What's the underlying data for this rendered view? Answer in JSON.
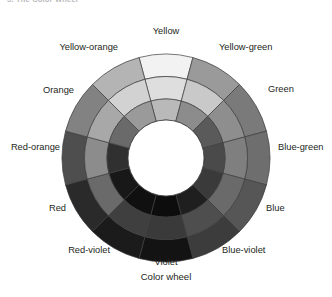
{
  "page": {
    "cutoff_heading": "5.  The Color Wheel",
    "caption": "Color wheel",
    "background_color": "#ffffff",
    "text_color": "#231f20"
  },
  "wheel": {
    "center_x": 166,
    "center_y": 158,
    "outer_radius": 104,
    "ring_radii": [
      104,
      81.5,
      59,
      38
    ],
    "stroke_color": "#3c3c3c",
    "hole_color": "#ffffff",
    "ring_names": [
      "outer",
      "middle",
      "inner"
    ],
    "sectors": [
      {
        "label": "Yellow",
        "angle_deg": 0,
        "label_x": 166,
        "label_y": 26,
        "label_align": "center",
        "shades": [
          "#f2f2f2",
          "#dedede",
          "#b9b9b9"
        ]
      },
      {
        "label": "Yellow-green",
        "angle_deg": 30,
        "label_x": 219,
        "label_y": 42,
        "label_align": "left",
        "shades": [
          "#9a9a9a",
          "#c9c9c9",
          "#8c8c8c"
        ]
      },
      {
        "label": "Green",
        "angle_deg": 60,
        "label_x": 268,
        "label_y": 84,
        "label_align": "left",
        "shades": [
          "#7a7a7a",
          "#8e8e8e",
          "#5a5a5a"
        ]
      },
      {
        "label": "Blue-green",
        "angle_deg": 90,
        "label_x": 278,
        "label_y": 142,
        "label_align": "left",
        "shades": [
          "#6e6e6e",
          "#7f7f7f",
          "#4a4a4a"
        ]
      },
      {
        "label": "Blue",
        "angle_deg": 120,
        "label_x": 266,
        "label_y": 203,
        "label_align": "left",
        "shades": [
          "#565656",
          "#6a6a6a",
          "#3a3a3a"
        ]
      },
      {
        "label": "Blue-violet",
        "angle_deg": 150,
        "label_x": 222,
        "label_y": 245,
        "label_align": "left",
        "shades": [
          "#3c3c3c",
          "#4e4e4e",
          "#1f1f1f"
        ]
      },
      {
        "label": "Violet",
        "angle_deg": 180,
        "label_x": 166,
        "label_y": 257,
        "label_align": "center",
        "shades": [
          "#131313",
          "#3a3a3a",
          "#0d0d0d"
        ]
      },
      {
        "label": "Red-violet",
        "angle_deg": 210,
        "label_x": 110,
        "label_y": 245,
        "label_align": "right",
        "shades": [
          "#1b1b1b",
          "#3f3f3f",
          "#101010"
        ]
      },
      {
        "label": "Red",
        "angle_deg": 240,
        "label_x": 66,
        "label_y": 203,
        "label_align": "right",
        "shades": [
          "#2a2a2a",
          "#6a6a6a",
          "#181818"
        ]
      },
      {
        "label": "Red-orange",
        "angle_deg": 270,
        "label_x": 60,
        "label_y": 142,
        "label_align": "right",
        "shades": [
          "#4e4e4e",
          "#8c8c8c",
          "#303030"
        ]
      },
      {
        "label": "Orange",
        "angle_deg": 300,
        "label_x": 74,
        "label_y": 85,
        "label_align": "right",
        "shades": [
          "#828282",
          "#a8a8a8",
          "#6a6a6a"
        ]
      },
      {
        "label": "Yellow-orange",
        "angle_deg": 330,
        "label_x": 118,
        "label_y": 42,
        "label_align": "right",
        "shades": [
          "#b4b4b4",
          "#d2d2d2",
          "#9a9a9a"
        ]
      }
    ]
  }
}
